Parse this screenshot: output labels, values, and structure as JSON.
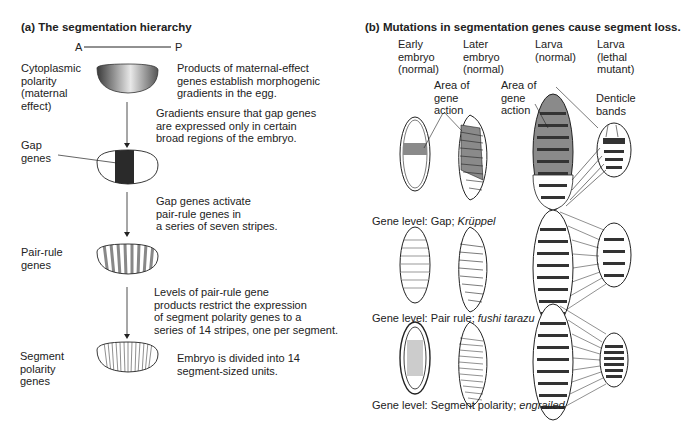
{
  "panel_a": {
    "title": "(a)  The segmentation hierarchy",
    "axis": {
      "anterior": "A",
      "posterior": "P"
    },
    "levels": [
      {
        "label": "Cytoplasmic\npolarity\n(maternal\neffect)",
        "description": "Products of maternal-effect\ngenes establish morphogenic\ngradients in the egg."
      },
      {
        "label": "Gap\ngenes",
        "description": ""
      },
      {
        "label": "Pair-rule\ngenes",
        "description": ""
      },
      {
        "label": "Segment\npolarity\ngenes",
        "description": "Embryo is divided into 14\nsegment-sized units."
      }
    ],
    "transitions": [
      "Gradients ensure that gap genes\nare expressed only in certain\nbroad regions of the embryo.",
      "Gap genes activate\npair-rule genes in\na series of seven stripes.",
      "Levels of pair-rule gene\nproducts restrict the expression\nof segment polarity genes to a\nseries of 14 stripes, one per segment."
    ]
  },
  "panel_b": {
    "title": "(b)  Mutations in segmentation genes cause segment loss.",
    "columns": [
      "Early\nembryo\n(normal)",
      "Later\nembryo\n(normal)",
      "Larva\n(normal)",
      "Larva\n(lethal\nmutant)"
    ],
    "annotations": {
      "area1": "Area of\ngene\naction",
      "area2": "Area of\ngene\naction",
      "denticle": "Denticle\nbands"
    },
    "rows": [
      {
        "prefix": "Gene level: Gap; ",
        "gene": "Krüppel"
      },
      {
        "prefix": "Gene level: Pair rule; ",
        "gene": "fushi tarazu"
      },
      {
        "prefix": "Gene level: Segment polarity; ",
        "gene": "engrailed"
      }
    ]
  },
  "colors": {
    "shade": "#8a8a8a",
    "dark": "#2a2a2a",
    "line": "#333333"
  }
}
